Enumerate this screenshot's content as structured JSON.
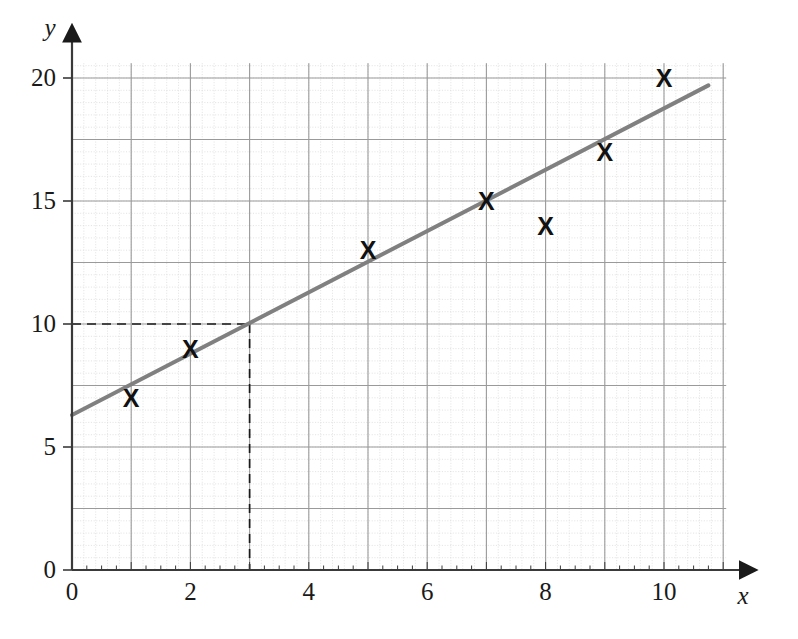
{
  "chart_data": {
    "type": "scatter",
    "title": "",
    "xlabel": "x",
    "ylabel": "y",
    "xlim": [
      0,
      11.2
    ],
    "ylim": [
      0,
      20.8
    ],
    "grid": true,
    "minor_grid": true,
    "legend": "none",
    "x_ticks": [
      0,
      2,
      4,
      6,
      8,
      10
    ],
    "x_tick_labels": [
      "0",
      "2",
      "4",
      "6",
      "8",
      "10"
    ],
    "y_ticks": [
      0,
      5,
      10,
      15,
      20
    ],
    "y_tick_labels": [
      "0",
      "5",
      "10",
      "15",
      "20"
    ],
    "x_major_step": 1,
    "y_major_step": 2.5,
    "marker_symbol": "X",
    "points": [
      {
        "x": 1,
        "y": 7,
        "label": "X"
      },
      {
        "x": 2,
        "y": 9,
        "label": "X"
      },
      {
        "x": 5,
        "y": 13,
        "label": "X"
      },
      {
        "x": 7,
        "y": 15,
        "label": "X"
      },
      {
        "x": 8,
        "y": 14,
        "label": "X"
      },
      {
        "x": 9,
        "y": 17,
        "label": "X"
      },
      {
        "x": 10,
        "y": 20,
        "label": "X"
      }
    ],
    "series": [
      {
        "name": "line of best fit",
        "type": "line",
        "x": [
          0,
          10.75
        ],
        "y": [
          6.3,
          19.7
        ],
        "color": "#808080"
      }
    ],
    "annotations": [
      {
        "name": "construction-lines",
        "type": "dashed-guide",
        "x": 3,
        "y": 10,
        "color": "#1a1a1a"
      }
    ]
  },
  "colors": {
    "line": "#808080",
    "major_grid": "#9a9a9a",
    "minor_grid": "#d9d9d9",
    "axis": "#3a3a3a",
    "text": "#1a1a1a",
    "marker": "#111111",
    "background": "#ffffff"
  }
}
